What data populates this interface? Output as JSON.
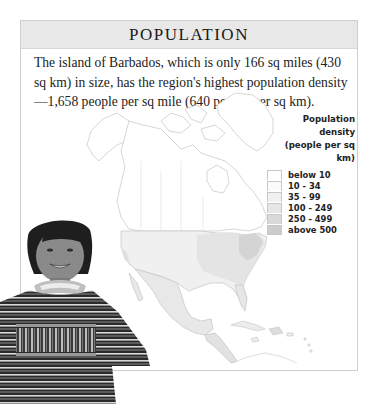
{
  "panel": {
    "title": "POPULATION",
    "description": "The island of Barbados, which is only 166 sq miles (430 sq km) in size, has the region's highest population density—1,658 people per sq mile (640 people per sq km)."
  },
  "legend": {
    "title_line1": "Population density",
    "title_line2": "(people per sq km)",
    "items": [
      {
        "label": "below 10",
        "color": "#ffffff"
      },
      {
        "label": "10 - 34",
        "color": "#fbfbfb"
      },
      {
        "label": "35 - 99",
        "color": "#f1f1f1"
      },
      {
        "label": "100 - 249",
        "color": "#e6e6e6"
      },
      {
        "label": "250 - 499",
        "color": "#dadada"
      },
      {
        "label": "above 500",
        "color": "#cccccc"
      }
    ]
  },
  "map": {
    "region": "North America, Central America and the Caribbean",
    "colors": {
      "outline": "#bdbdbd",
      "low": "#ffffff",
      "usa_base": "#f0f0f0",
      "usa_east": "#e2e2e2",
      "usa_northeast": "#d2d2d2",
      "mexico": "#e8e8e8",
      "central_america": "#e2e2e2"
    }
  },
  "photo": {
    "subject": "smiling girl wearing a striped woven poncho"
  }
}
